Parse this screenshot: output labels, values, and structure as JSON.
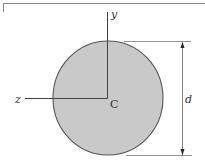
{
  "diagram": {
    "labels": {
      "y_axis": "y",
      "z_axis": "z",
      "centroid": "C",
      "diameter": "d"
    },
    "colors": {
      "fill": "#c9c9c9",
      "stroke": "#555555",
      "axis": "#444444",
      "dimension": "#666666"
    }
  }
}
